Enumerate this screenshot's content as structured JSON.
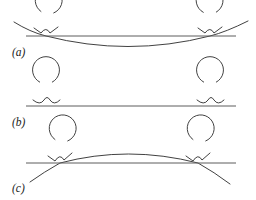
{
  "figure": {
    "width": 256,
    "height": 200,
    "background_color": "#ffffff",
    "curve_color": "#2b2b2b",
    "baseline_color": "#5d5d5d",
    "label_color": "#1a1a1a"
  },
  "panels": [
    {
      "id": "panel-a",
      "label": "(a)",
      "label_x": 12,
      "label_y": 56,
      "baseline": {
        "x1": 26,
        "y1": 36,
        "x2": 236,
        "y2": 36
      },
      "main_curve": {
        "description": "concave-up arc dipping below the baseline between the two contact points",
        "path": "M 14 22 Q 30 32 46 36 Q 128 57 210 36 Q 226 32 248 21"
      },
      "contact_points": [
        {
          "x": 46,
          "y": 36
        },
        {
          "x": 210,
          "y": 36
        }
      ],
      "insets": [
        {
          "center_x": 46,
          "center_y": 24,
          "radius": 13.5,
          "gap_start_deg": 55,
          "gap_end_deg": 112,
          "cusp_path": "M 34 28 L 41 33 Q 46 26 50 33 L 58 27"
        },
        {
          "center_x": 210,
          "center_y": 24,
          "radius": 13.5,
          "gap_start_deg": 62,
          "gap_end_deg": 120,
          "cusp_path": "M 198 28 L 205 33 Q 210 26 214 33 L 222 27"
        }
      ]
    },
    {
      "id": "panel-b",
      "label": "(b)",
      "label_x": 12,
      "label_y": 126,
      "baseline": {
        "x1": 26,
        "y1": 106,
        "x2": 236,
        "y2": 106
      },
      "main_curve": {
        "description": "flat horizontal substrate, no bending",
        "path": ""
      },
      "contact_points": [
        {
          "x": 46,
          "y": 106
        },
        {
          "x": 210,
          "y": 106
        }
      ],
      "insets": [
        {
          "center_x": 46,
          "center_y": 94,
          "radius": 13.5,
          "gap_start_deg": 62,
          "gap_end_deg": 118,
          "cusp_path": "M 33 100 Q 40 106 44 100 Q 47 95 50 100 Q 54 106 60 100"
        },
        {
          "center_x": 210,
          "center_y": 94,
          "radius": 13.5,
          "gap_start_deg": 62,
          "gap_end_deg": 118,
          "cusp_path": "M 197 100 Q 204 106 208 100 Q 211 95 214 100 Q 218 106 224 100"
        }
      ]
    },
    {
      "id": "panel-c",
      "label": "(c)",
      "label_x": 12,
      "label_y": 192,
      "baseline": {
        "x1": 26,
        "y1": 163,
        "x2": 236,
        "y2": 163
      },
      "main_curve": {
        "description": "concave-down arc bulging above the baseline between the two contact points",
        "path": "M 30 182 Q 44 172 60 163 Q 128 145 198 163 Q 214 172 230 184"
      },
      "contact_points": [
        {
          "x": 60,
          "y": 163
        },
        {
          "x": 198,
          "y": 163
        }
      ],
      "insets": [
        {
          "center_x": 60,
          "center_y": 152,
          "radius": 13.5,
          "gap_start_deg": 55,
          "gap_end_deg": 112,
          "cusp_path": "M 48 156 L 55 161 Q 60 153 64 160 L 72 153"
        },
        {
          "center_x": 198,
          "center_y": 152,
          "radius": 13.5,
          "gap_start_deg": 55,
          "gap_end_deg": 112,
          "cusp_path": "M 186 156 L 193 161 Q 198 153 202 160 L 210 153"
        }
      ]
    }
  ]
}
